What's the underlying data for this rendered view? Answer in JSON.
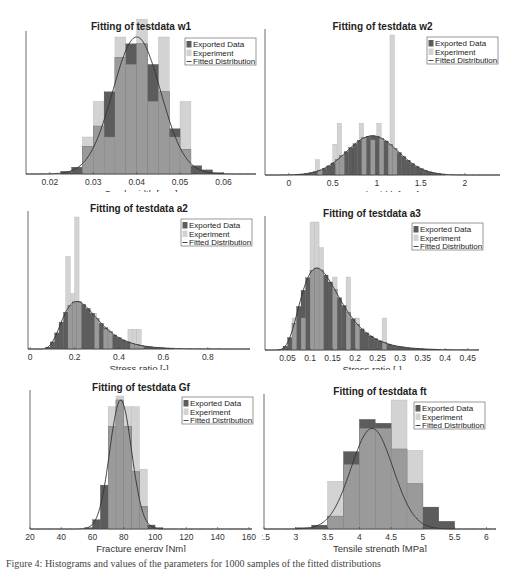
{
  "figure": {
    "caption": "Figure 4: Histograms and values of the parameters for 1000 samples of the fitted distributions"
  },
  "legend": {
    "exported": "Exported Data",
    "experiment": "Experiment",
    "fitted": "Fitted Distribution"
  },
  "colors": {
    "exported": "#5c5c5c",
    "experiment": "#d3d3d3",
    "overlap": "#9a9a9a",
    "fit_line": "#333333",
    "axis": "#444444"
  },
  "chart_data": [
    {
      "id": "w1",
      "type": "bar",
      "title": "Fitting of testdata w1",
      "xlabel": "Crack width [mm]",
      "ylabel": "",
      "xticks": [
        0.02,
        0.03,
        0.04,
        0.05,
        0.06
      ],
      "xlim": [
        0.0145,
        0.0675
      ],
      "bin_width": 0.0025,
      "series": [
        {
          "name": "Exported Data",
          "bins_left": [
            0.0225,
            0.025,
            0.0275,
            0.03,
            0.0325,
            0.035,
            0.0375,
            0.04,
            0.0425,
            0.045,
            0.0475,
            0.05,
            0.0525,
            0.055,
            0.0575
          ],
          "values": [
            0.02,
            0.05,
            0.2,
            0.35,
            0.6,
            0.85,
            0.95,
            0.95,
            0.8,
            0.6,
            0.33,
            0.18,
            0.06,
            0.03,
            0.01
          ]
        },
        {
          "name": "Experiment",
          "bins_left": [
            0.0275,
            0.03,
            0.0325,
            0.035,
            0.0375,
            0.04,
            0.0425,
            0.045,
            0.0475,
            0.05
          ],
          "values": [
            0.27,
            0.53,
            0.27,
            1.0,
            0.8,
            1.13,
            0.53,
            1.0,
            0.27,
            0.53
          ]
        },
        {
          "name": "Fitted Distribution",
          "type": "line",
          "mean": 0.04,
          "std": 0.0055,
          "peak": 1.0
        }
      ]
    },
    {
      "id": "w2",
      "type": "bar",
      "title": "Fitting of testdata w2",
      "xlabel": "Crack width [mm]",
      "ylabel": "",
      "xticks": [
        0,
        0.5,
        1,
        1.5,
        2
      ],
      "xlim": [
        -0.27,
        2.4
      ],
      "bin_width": 0.05,
      "series": [
        {
          "name": "Exported Data",
          "type": "dense_histogram",
          "mean": 0.95,
          "std": 0.29,
          "peak": 0.28
        },
        {
          "name": "Experiment",
          "bins_left": [
            0.3,
            0.5,
            0.55,
            0.8,
            0.9,
            1.0,
            1.1,
            1.15
          ],
          "values": [
            0.11,
            0.22,
            0.37,
            0.37,
            0.25,
            0.37,
            0.22,
            1.0
          ]
        },
        {
          "name": "Fitted Distribution",
          "type": "line",
          "mean": 0.95,
          "std": 0.29,
          "peak": 0.28
        }
      ]
    },
    {
      "id": "a2",
      "type": "bar",
      "title": "Fitting of testdata a2",
      "xlabel": "Stress ratio [-]",
      "ylabel": "",
      "xticks": [
        0,
        0.2,
        0.4,
        0.6,
        0.8
      ],
      "xlim": [
        -0.01,
        0.99
      ],
      "bin_width": 0.02,
      "series": [
        {
          "name": "Exported Data",
          "type": "dense_histogram",
          "distribution": "lognormal",
          "mode": 0.21,
          "peak": 0.36
        },
        {
          "name": "Experiment",
          "bins_left": [
            0.16,
            0.18,
            0.2,
            0.28,
            0.32,
            0.34,
            0.44,
            0.46,
            0.48
          ],
          "values": [
            0.7,
            0.42,
            1.0,
            0.27,
            0.15,
            0.15,
            0.15,
            0.15,
            0.15
          ]
        },
        {
          "name": "Fitted Distribution",
          "type": "line",
          "distribution": "lognormal",
          "mode": 0.21,
          "peak": 0.36
        }
      ]
    },
    {
      "id": "a3",
      "type": "bar",
      "title": "Fitting of testdata a3",
      "xlabel": "Stress ratio [-]",
      "ylabel": "",
      "xticks": [
        0.05,
        0.1,
        0.15,
        0.2,
        0.25,
        0.3,
        0.35,
        0.4,
        0.45
      ],
      "xlim": [
        0.0,
        0.475
      ],
      "bin_width": 0.01,
      "series": [
        {
          "name": "Exported Data",
          "type": "dense_histogram",
          "distribution": "lognormal",
          "mode": 0.115,
          "peak": 0.64
        },
        {
          "name": "Experiment",
          "bins_left": [
            0.06,
            0.08,
            0.1,
            0.11,
            0.12,
            0.15,
            0.18,
            0.2,
            0.26
          ],
          "values": [
            0.25,
            0.25,
            1.0,
            1.0,
            0.8,
            0.57,
            0.57,
            0.25,
            0.25
          ]
        },
        {
          "name": "Fitted Distribution",
          "type": "line",
          "distribution": "lognormal",
          "mode": 0.115,
          "peak": 0.64
        }
      ]
    },
    {
      "id": "Gf",
      "type": "bar",
      "title": "Fitting of testdata Gf",
      "xlabel": "Fracture energy [Nm]",
      "ylabel": "",
      "xticks": [
        20,
        40,
        60,
        80,
        100,
        120,
        140,
        160
      ],
      "xlim": [
        20,
        162
      ],
      "bin_width": 5,
      "series": [
        {
          "name": "Exported Data",
          "bins_left": [
            55,
            60,
            65,
            70,
            75,
            80,
            85,
            90,
            95,
            100
          ],
          "values": [
            0.01,
            0.07,
            0.33,
            0.77,
            0.97,
            0.77,
            0.43,
            0.17,
            0.03,
            0.01
          ]
        },
        {
          "name": "Experiment",
          "bins_left": [
            70,
            75,
            80,
            85,
            90
          ],
          "values": [
            0.92,
            1.0,
            0.92,
            0.92,
            0.45
          ]
        },
        {
          "name": "Fitted Distribution",
          "type": "line",
          "mean": 78,
          "std": 7,
          "peak": 0.97
        }
      ]
    },
    {
      "id": "ft",
      "type": "bar",
      "title": "Fitting of testdata ft",
      "xlabel": "Tensile strength [MPa]",
      "ylabel": "",
      "xticks": [
        2.5,
        3,
        3.5,
        4,
        4.5,
        5,
        5.5,
        6
      ],
      "xlim": [
        2.5,
        6.15
      ],
      "bin_width": 0.25,
      "series": [
        {
          "name": "Exported Data",
          "bins_left": [
            3.0,
            3.25,
            3.5,
            3.75,
            4.0,
            4.25,
            4.5,
            4.75,
            5.0,
            5.25
          ],
          "values": [
            0.01,
            0.03,
            0.1,
            0.6,
            0.85,
            0.82,
            0.62,
            0.35,
            0.17,
            0.06
          ]
        },
        {
          "name": "Experiment",
          "bins_left": [
            3.5,
            3.75,
            4.0,
            4.25,
            4.5,
            4.75
          ],
          "values": [
            0.37,
            0.5,
            0.78,
            0.78,
            1.0,
            0.61
          ]
        },
        {
          "name": "Fitted Distribution",
          "type": "line",
          "mean": 4.2,
          "std": 0.33,
          "peak": 0.78
        }
      ]
    }
  ]
}
